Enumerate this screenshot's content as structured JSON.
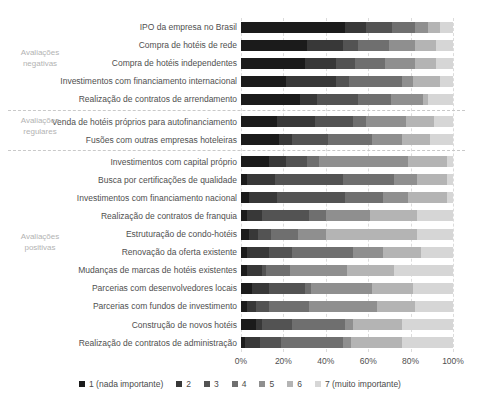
{
  "chart_data": {
    "type": "bar",
    "variant": "horizontal-stacked-100",
    "title": "",
    "xlabel": "",
    "ylabel": "",
    "xlim": [
      0,
      100
    ],
    "grid": "vertical-dashed",
    "x_ticks": [
      "0%",
      "20%",
      "40%",
      "60%",
      "80%",
      "100%"
    ],
    "palette": [
      "#1b1b1b",
      "#383838",
      "#535353",
      "#6f6f6f",
      "#8f8f8f",
      "#b4b4b4",
      "#d6d6d6"
    ],
    "legend_position": "bottom",
    "legend": [
      {
        "label": "1 (nada importante)",
        "color": "#1b1b1b"
      },
      {
        "label": "2",
        "color": "#383838"
      },
      {
        "label": "3",
        "color": "#535353"
      },
      {
        "label": "4",
        "color": "#6f6f6f"
      },
      {
        "label": "5",
        "color": "#8f8f8f"
      },
      {
        "label": "6",
        "color": "#b4b4b4"
      },
      {
        "label": "7 (muito importante)",
        "color": "#d6d6d6"
      }
    ],
    "groups": [
      {
        "lines": [
          "Avaliações",
          "negativas"
        ],
        "start": 0,
        "end": 4,
        "label_top": 47
      },
      {
        "lines": [
          "Avaliações",
          "regulares"
        ],
        "start": 5,
        "end": 6,
        "label_top": 115
      },
      {
        "lines": [
          "Avaliações",
          "positivas"
        ],
        "start": 7,
        "end": 17,
        "label_top": 231
      }
    ],
    "dividers_after_rows": [
      4,
      6
    ],
    "rows": [
      {
        "label": "IPO da empresa no Brasil",
        "values": [
          49,
          10,
          12,
          11,
          6,
          6,
          6
        ]
      },
      {
        "label": "Compra de hotéis de rede",
        "values": [
          31,
          17,
          7,
          15,
          12,
          10,
          8
        ]
      },
      {
        "label": "Compra de hotéis independentes",
        "values": [
          30,
          15,
          9,
          14,
          14,
          10,
          8
        ]
      },
      {
        "label": "Investimentos com financiamento internacional",
        "values": [
          21,
          24,
          6,
          25,
          5,
          13,
          6
        ]
      },
      {
        "label": "Realização de contratos de arrendamento",
        "values": [
          28,
          8,
          19,
          16,
          15,
          2,
          12
        ]
      },
      {
        "label": "Venda de hotéis próprios para autofinanciamento",
        "values": [
          17,
          18,
          18,
          6,
          19,
          13,
          9
        ]
      },
      {
        "label": "Fusões com outras empresas hoteleiras",
        "values": [
          18,
          6,
          17,
          21,
          14,
          13,
          11
        ]
      },
      {
        "label": "Investimentos com capital próprio",
        "values": [
          13,
          8,
          10,
          6,
          42,
          18,
          3
        ]
      },
      {
        "label": "Busca por certificações de qualidade",
        "values": [
          3,
          13,
          32,
          24,
          11,
          14,
          3
        ]
      },
      {
        "label": "Investimentos com financiamento nacional",
        "values": [
          4,
          13,
          32,
          18,
          12,
          18,
          3
        ]
      },
      {
        "label": "Realização de contratos de franquia",
        "values": [
          3,
          7,
          22,
          8,
          21,
          22,
          17
        ]
      },
      {
        "label": "Estruturação de condo-hotéis",
        "values": [
          4,
          4,
          6,
          13,
          13,
          43,
          17
        ]
      },
      {
        "label": "Renovação da oferta existente",
        "values": [
          3,
          10,
          11,
          29,
          14,
          18,
          15
        ]
      },
      {
        "label": "Mudanças de marcas de hotéis existentes",
        "values": [
          3,
          7,
          2,
          11,
          27,
          22,
          28
        ]
      },
      {
        "label": "Parcerias com desenvolvedores locais",
        "values": [
          5,
          8,
          17,
          3,
          29,
          19,
          19
        ]
      },
      {
        "label": "Parcerias com fundos de investimento",
        "values": [
          3,
          4,
          6,
          19,
          32,
          18,
          18
        ]
      },
      {
        "label": "Construção de novos hotéis",
        "values": [
          7,
          3,
          14,
          25,
          4,
          23,
          24
        ]
      },
      {
        "label": "Realização de contratos de administração",
        "values": [
          2,
          7,
          10,
          29,
          4,
          24,
          24
        ]
      }
    ]
  }
}
